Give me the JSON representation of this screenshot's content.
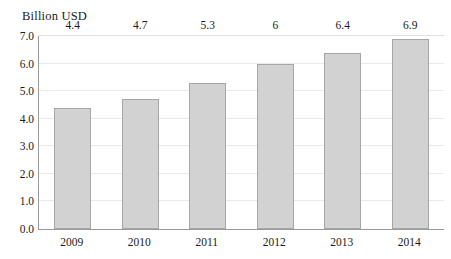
{
  "chart_data": {
    "type": "bar",
    "title": "",
    "ylabel": "Billion USD",
    "xlabel": "",
    "categories": [
      "2009",
      "2010",
      "2011",
      "2012",
      "2013",
      "2014"
    ],
    "values": [
      4.4,
      4.7,
      5.3,
      6,
      6.4,
      6.9
    ],
    "value_labels": [
      "4.4",
      "4.7",
      "5.3",
      "6",
      "6.4",
      "6.9"
    ],
    "ylim": [
      0,
      7
    ],
    "ytick_labels": [
      "0.0",
      "1.0",
      "2.0",
      "3.0",
      "4.0",
      "5.0",
      "6.0",
      "7.0"
    ],
    "ytick_values": [
      0,
      1,
      2,
      3,
      4,
      5,
      6,
      7
    ],
    "grid": true,
    "legend": "none",
    "colors": {
      "bar_fill": "#d2d2d2",
      "bar_border": "#a6a6a6",
      "gridline": "#e9e9e9",
      "axis_line": "#9a9a9a",
      "text": "#1a1a1a",
      "background": "#ffffff"
    }
  }
}
